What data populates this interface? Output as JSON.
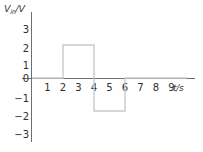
{
  "chart_data": {
    "type": "line",
    "title": "",
    "subtitle": "",
    "ylabel": "Vin/V",
    "ylabel_main": "V",
    "ylabel_sub": "in",
    "ylabel_unit": "/V",
    "xlabel": "t/s",
    "grid": false,
    "legend": "none",
    "xlim": [
      0,
      10
    ],
    "ylim": [
      -3.5,
      3.5
    ],
    "xticks": [
      1,
      2,
      3,
      4,
      5,
      6,
      7,
      8,
      9
    ],
    "xtick_labels": [
      "1",
      "2",
      "3",
      "4",
      "5",
      "6",
      "7",
      "8",
      "9"
    ],
    "yticks": [
      3,
      2,
      1,
      0,
      -1,
      -2,
      -3
    ],
    "ytick_labels": [
      "3",
      "2",
      "1",
      "0",
      "−1",
      "−2",
      "−3"
    ],
    "series": [
      {
        "name": "Vin",
        "color": "#c9c9c9",
        "x": [
          0,
          2,
          2,
          4,
          4,
          6,
          6,
          10
        ],
        "values": [
          0,
          0,
          2,
          2,
          -2,
          -2,
          0,
          0
        ],
        "description": "Square pulse: +2 V from t=2 s to t=4 s, −2 V from t=4 s to t=6 s, 0 V elsewhere"
      }
    ],
    "annotations": []
  },
  "colors": {
    "axis": "#6f6f6f",
    "wave": "#c9c9c9",
    "tick_text": "#2e2e2e",
    "label_text": "#3a3a3a",
    "background": "#ffffff"
  }
}
